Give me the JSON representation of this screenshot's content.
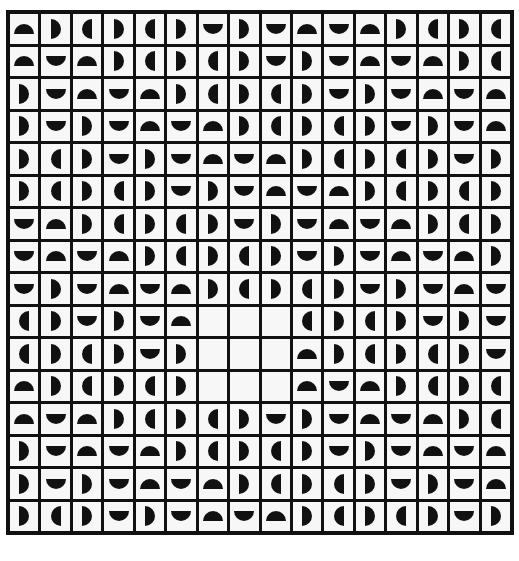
{
  "puzzle": {
    "rows": 16,
    "cols": 16,
    "legend": {
      "U": "semicircle-up",
      "N": "semicircle-down",
      "R": "semicircle-right",
      "L": "semicircle-left",
      "E": "empty"
    },
    "colors": {
      "shape": "#111111",
      "cell": "#f7f7f7",
      "grid": "#111111"
    },
    "grid": [
      "URLRLRNRNUNURLRL",
      "UNURLRLRNRNUNURL",
      "RNUNURLRLRNRNUNU",
      "RNRNUNURLRLRNRNU",
      "RLRNRNUNURLRLRNR",
      "RLRLRNRNUNURLRLR",
      "NURLRLRNRNUNURLR",
      "NUNURLRLRNRNUNUR",
      "NRNUNURLRLRNRNUN",
      "LRNRNUEEELRLRNRN",
      "LRLRNREEEURLRLRN",
      "URLRLREEEUNURLRL",
      "UNURLRLRNRNUNURL",
      "RNUNURLRLRNRNUNU",
      "RNRNUNURLRLRNRNU",
      "RLRNRNUNURLRLRNR"
    ]
  }
}
